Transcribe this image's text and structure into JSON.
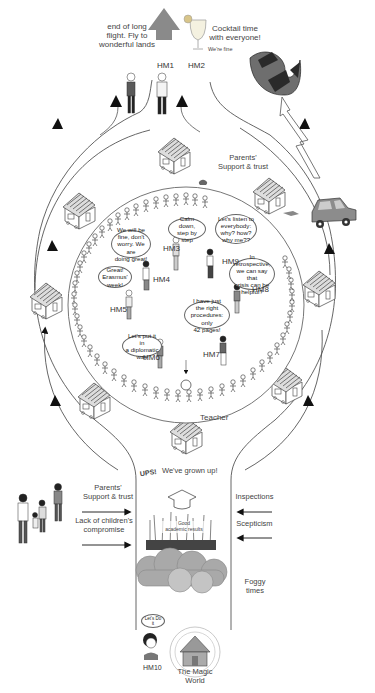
{
  "top": {
    "hm1_caption": "end of long\nflight. Fly to\nwonderful lands",
    "hm2_caption": "Cocktail time\nwith everyone!",
    "hm2_sub": "We're fine",
    "hm1_label": "HM1",
    "hm2_label": "HM2"
  },
  "outer_ring": {
    "label": "Parents'\nSupport & trust",
    "houses_count": 8
  },
  "inner_circle": {
    "bubbles": [
      {
        "id": "HM3",
        "text": "Calm down,\nstep by step"
      },
      {
        "id": "HM9",
        "text": "Let's listen to\neverybody:\nwhy? how?\nwhy me??"
      },
      {
        "id": "HM4",
        "text": "We will be\nfine, don't\nworry. We are\ndoing great!"
      },
      {
        "id": "HM8",
        "text": "In\nretrospective,\nwe can say that\ncrisis can be\nhelpful?"
      },
      {
        "id": "HM5",
        "text": "Great!\nErasmus'\nweek!"
      },
      {
        "id": "HM7",
        "text": "I have just\nthe right\nprocedures: only\n42 pages!"
      },
      {
        "id": "HM6",
        "text": "Let's put it in\na diplomatic\nway"
      }
    ],
    "labels": [
      "HM3",
      "HM9",
      "HM4",
      "HM8",
      "HM5",
      "HM7",
      "HM6"
    ],
    "teacher_label": "Teacher"
  },
  "channel": {
    "title_prefix": "UPS!",
    "title": "We've grown up!",
    "left_forces": [
      "Parents'\nSupport & trust",
      "Lack of children's\ncompromise"
    ],
    "right_forces": [
      "Inspections",
      "Scepticism"
    ],
    "center_label": "Good\nacademic results",
    "cloud_label": "Foggy\ntimes"
  },
  "bottom": {
    "hm10_bubble": "Let's Do\nit",
    "hm10_label": "HM10",
    "magic_world": "The Magic\nWorld"
  },
  "colors": {
    "line": "#555555",
    "cloud": "#a9a9a9",
    "arrow_up": "#8a8a8a",
    "bird_dark": "#2a2a2a",
    "bird_mid": "#6e6e6e",
    "car": "#8c8c8c"
  }
}
